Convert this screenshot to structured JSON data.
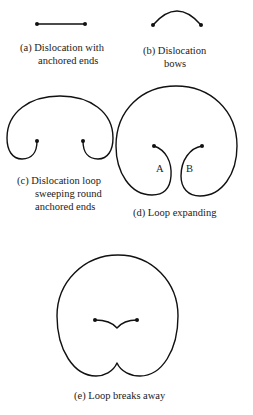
{
  "panels": [
    {
      "id": "a",
      "caption_lines": [
        "(a)  Dislocation with",
        "anchored ends"
      ]
    },
    {
      "id": "b",
      "caption_lines": [
        "(b)  Dislocation",
        "bows"
      ]
    },
    {
      "id": "c",
      "caption_lines": [
        "(c)  Dislocation loop",
        "sweeping round",
        "anchored ends"
      ]
    },
    {
      "id": "d",
      "caption_lines": [
        "(d)  Loop expanding"
      ],
      "point_labels": [
        "A",
        "B"
      ]
    },
    {
      "id": "e",
      "caption_lines": [
        "(e)  Loop breaks away"
      ]
    }
  ],
  "colors": {
    "line": "#111111",
    "text": "#1a1a1a",
    "background": "#ffffff"
  }
}
